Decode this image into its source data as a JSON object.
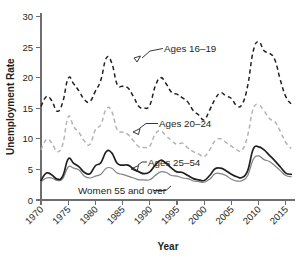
{
  "chart_data": {
    "type": "line",
    "title": "",
    "xlabel": "Year",
    "ylabel": "Unemployment Rate",
    "xlim": [
      1970,
      2016
    ],
    "ylim": [
      0,
      30
    ],
    "grid": false,
    "legend_position": "inline-annotations",
    "xticks": [
      1970,
      1975,
      1980,
      1985,
      1990,
      1995,
      2000,
      2005,
      2010,
      2015
    ],
    "xtick_labels": [
      "1970",
      "1975",
      "1980",
      "1985",
      "1990",
      "1995",
      "2000",
      "2005",
      "2010",
      "2015"
    ],
    "yticks": [
      0,
      5,
      10,
      15,
      20,
      25,
      30
    ],
    "ytick_labels": [
      "0",
      "5",
      "10",
      "15",
      "20",
      "25",
      "30"
    ],
    "x": [
      1970,
      1971,
      1972,
      1973,
      1974,
      1975,
      1976,
      1977,
      1978,
      1979,
      1980,
      1981,
      1982,
      1983,
      1984,
      1985,
      1986,
      1987,
      1988,
      1989,
      1990,
      1991,
      1992,
      1993,
      1994,
      1995,
      1996,
      1997,
      1998,
      1999,
      2000,
      2001,
      2002,
      2003,
      2004,
      2005,
      2006,
      2007,
      2008,
      2009,
      2010,
      2011,
      2012,
      2013,
      2014,
      2015,
      2016
    ],
    "series": [
      {
        "name": "Ages 16-19",
        "label": "Ages 16–19",
        "style": "dashed",
        "color": "#231f20",
        "values": [
          15.3,
          16.9,
          16.2,
          14.5,
          16.0,
          19.9,
          19.0,
          17.8,
          16.4,
          16.1,
          17.8,
          19.6,
          23.2,
          22.4,
          18.9,
          18.6,
          18.3,
          16.9,
          15.3,
          15.0,
          15.5,
          18.6,
          20.0,
          19.0,
          17.6,
          17.3,
          16.7,
          16.0,
          14.6,
          13.9,
          13.1,
          14.7,
          16.5,
          17.5,
          17.0,
          16.6,
          15.4,
          15.7,
          18.7,
          24.3,
          25.9,
          24.4,
          24.0,
          22.9,
          19.6,
          16.9,
          15.7
        ]
      },
      {
        "name": "Ages 20-24",
        "label": "Ages 20–24",
        "style": "dashed",
        "color": "#b4b4b4",
        "values": [
          8.2,
          9.9,
          9.3,
          7.9,
          9.1,
          13.6,
          12.0,
          11.0,
          9.6,
          9.1,
          11.5,
          12.3,
          14.9,
          14.5,
          11.5,
          11.1,
          10.7,
          9.7,
          8.7,
          8.6,
          8.8,
          10.8,
          11.3,
          10.5,
          9.7,
          9.1,
          9.3,
          8.5,
          7.9,
          7.5,
          7.1,
          8.2,
          9.7,
          10.0,
          9.4,
          8.8,
          8.2,
          8.2,
          10.6,
          14.9,
          15.5,
          14.6,
          13.3,
          12.8,
          11.2,
          9.4,
          8.4
        ]
      },
      {
        "name": "Ages 25-54",
        "label": "Ages 25–54",
        "style": "solid",
        "color": "#231f20",
        "values": [
          3.2,
          4.4,
          4.1,
          3.4,
          3.9,
          6.7,
          6.0,
          5.4,
          4.5,
          4.3,
          5.6,
          6.1,
          7.9,
          7.7,
          6.0,
          5.7,
          5.7,
          5.1,
          4.6,
          4.3,
          4.6,
          5.7,
          6.5,
          6.0,
          5.2,
          4.6,
          4.5,
          4.0,
          3.5,
          3.3,
          3.2,
          4.0,
          5.1,
          5.2,
          4.8,
          4.2,
          3.8,
          3.7,
          4.8,
          8.3,
          8.7,
          8.2,
          7.3,
          6.4,
          5.4,
          4.4,
          4.2
        ]
      },
      {
        "name": "Women 55 and over",
        "label": "Women 55 and over",
        "style": "solid",
        "color": "#808285",
        "values": [
          3.0,
          3.6,
          3.6,
          3.2,
          3.5,
          5.4,
          5.2,
          4.9,
          3.9,
          3.6,
          3.9,
          4.2,
          5.2,
          5.2,
          4.4,
          4.2,
          3.9,
          3.6,
          3.3,
          3.3,
          3.3,
          4.0,
          4.6,
          4.5,
          4.0,
          3.9,
          3.6,
          3.5,
          3.1,
          3.0,
          2.9,
          3.4,
          4.3,
          4.3,
          4.0,
          3.4,
          3.1,
          3.2,
          4.0,
          6.6,
          7.2,
          6.6,
          6.3,
          5.6,
          4.8,
          4.0,
          3.8
        ]
      }
    ],
    "annotations": [
      {
        "text": "Ages 16–19",
        "x": 1985,
        "y": 24.5
      },
      {
        "text": "Ages 20–24",
        "x": 1984,
        "y": 10.8
      },
      {
        "text": "Ages 25–54",
        "x": 1984,
        "y": 5.4
      },
      {
        "text": "Women 55 and over",
        "x": 1981,
        "y": 1.7
      }
    ]
  }
}
